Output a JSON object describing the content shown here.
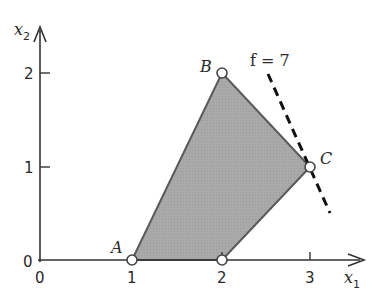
{
  "diagram": {
    "type": "linear-programming-feasible-region",
    "axes": {
      "x_label": "x",
      "x_sub": "1",
      "y_label": "x",
      "y_sub": "2",
      "x_ticks": [
        "0",
        "1",
        "2",
        "3"
      ],
      "y_ticks": [
        "0",
        "1",
        "2"
      ]
    },
    "region": {
      "vertices": [
        {
          "name": "A",
          "x": 1,
          "y": 0
        },
        {
          "name": "B",
          "x": 2,
          "y": 2
        },
        {
          "name": "C",
          "x": 3,
          "y": 1
        },
        {
          "name": "",
          "x": 2,
          "y": 0
        }
      ],
      "fill_color": "#a8a8a8",
      "edge_color": "#555555"
    },
    "objective_line": {
      "label": "f = 7",
      "style": "dashed"
    },
    "point_labels": {
      "A": "A",
      "B": "B",
      "C": "C"
    }
  }
}
